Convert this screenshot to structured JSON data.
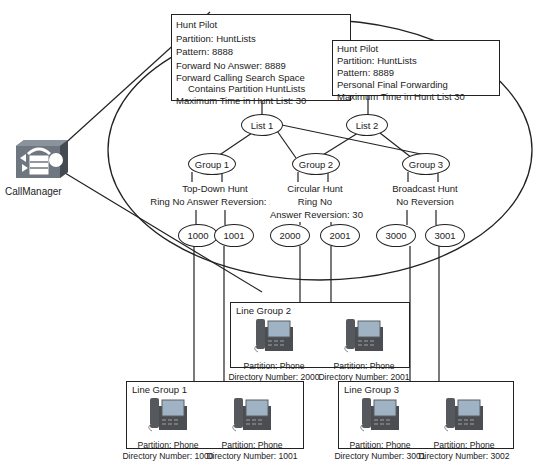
{
  "callmanager": {
    "label": "CallManager",
    "icon": "callmanager-router-icon"
  },
  "hunt_pilots": [
    {
      "title": "Hunt Pilot",
      "partition": "Partition: HuntLists",
      "pattern": "Pattern: 8888",
      "forward_no_answer": "Forward No Answer: 8889",
      "forward_css_1": "Forward Calling Search Space",
      "forward_css_2": "Contains Partition HuntLists",
      "max_time": "Maximum Time in Hunt List: 30"
    },
    {
      "title": "Hunt Pilot",
      "partition": "Partition: HuntLists",
      "pattern": "Pattern: 8889",
      "forwarding": "Personal Final Forwarding",
      "max_time": "Maximum Time in Hunt List 30"
    }
  ],
  "hunt_lists": [
    {
      "label": "List 1"
    },
    {
      "label": "List 2"
    }
  ],
  "groups": [
    {
      "label": "Group 1",
      "desc_1": "Top-Down Hunt",
      "desc_2": "Ring No Answer Reversion: 10"
    },
    {
      "label": "Group 2",
      "desc_1": "Circular Hunt",
      "desc_2": "Ring No",
      "desc_3": "Answer Reversion: 30"
    },
    {
      "label": "Group 3",
      "desc_1": "Broadcast Hunt",
      "desc_2": "No Reversion"
    }
  ],
  "members": [
    "1000",
    "1001",
    "2000",
    "2001",
    "3000",
    "3001"
  ],
  "line_groups": [
    {
      "title": "Line Group 1",
      "phones": [
        {
          "partition": "Partition: Phone",
          "dn": "Directory Number: 1000"
        },
        {
          "partition": "Partition: Phone",
          "dn": "Directory Number: 1001"
        }
      ]
    },
    {
      "title": "Line Group 2",
      "phones": [
        {
          "partition": "Partition: Phone",
          "dn": "Directory Number: 2000"
        },
        {
          "partition": "Partition: Phone",
          "dn": "Directory Number: 2001"
        }
      ]
    },
    {
      "title": "Line Group 3",
      "phones": [
        {
          "partition": "Partition: Phone",
          "dn": "Directory Number: 3001"
        },
        {
          "partition": "Partition: Phone",
          "dn": "Directory Number: 3002"
        }
      ]
    }
  ],
  "colors": {
    "line": "#222222",
    "phone_body": "#55595e",
    "phone_screen": "#9fb3c4",
    "router": "#6e7680"
  }
}
